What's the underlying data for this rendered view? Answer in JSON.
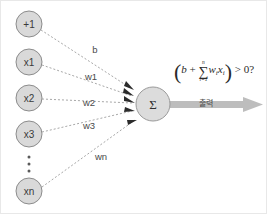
{
  "diagram": {
    "colors": {
      "node_fill": "#d9d9d9",
      "node_stroke": "#8c8c8c",
      "sum_fill": "#dcdcdc",
      "edge": "#9d9d9d",
      "arrowhead": "#2b2b2b",
      "output_arrow": "#bdbdbd",
      "background": "#ffffff"
    },
    "input_nodes": [
      {
        "label": "+1",
        "cx": 28,
        "cy": 23,
        "r": 13
      },
      {
        "label": "x1",
        "cx": 28,
        "cy": 61,
        "r": 13
      },
      {
        "label": "x2",
        "cx": 28,
        "cy": 97,
        "r": 13
      },
      {
        "label": "x3",
        "cx": 28,
        "cy": 133,
        "r": 13
      },
      {
        "label": "xn",
        "cx": 28,
        "cy": 190,
        "r": 13
      }
    ],
    "ellipsis": {
      "label": "vertical-ellipsis",
      "cx": 28,
      "cy": 163
    },
    "edge_labels": [
      {
        "label": "b",
        "x": 94,
        "y": 48
      },
      {
        "label": "w1",
        "x": 90,
        "y": 75
      },
      {
        "label": "w2",
        "x": 88,
        "y": 101
      },
      {
        "label": "w3",
        "x": 88,
        "y": 124
      },
      {
        "label": "wn",
        "x": 100,
        "y": 155
      }
    ],
    "sum_node": {
      "label": "Σ",
      "name": "summation-node",
      "cx": 152,
      "cy": 103,
      "r": 17
    },
    "formula": {
      "open_paren": "(",
      "bias": "b",
      "plus": "+",
      "sum_upper": "n",
      "sum_symbol": "∑",
      "sum_lower": "i=1",
      "weight_term": "w",
      "weight_sub": "i",
      "input_term": "x",
      "input_sub": "i",
      "close_paren": ")",
      "comparison": "> 0?"
    },
    "output": {
      "label": "출력",
      "arrow_name": "output-arrow"
    }
  }
}
